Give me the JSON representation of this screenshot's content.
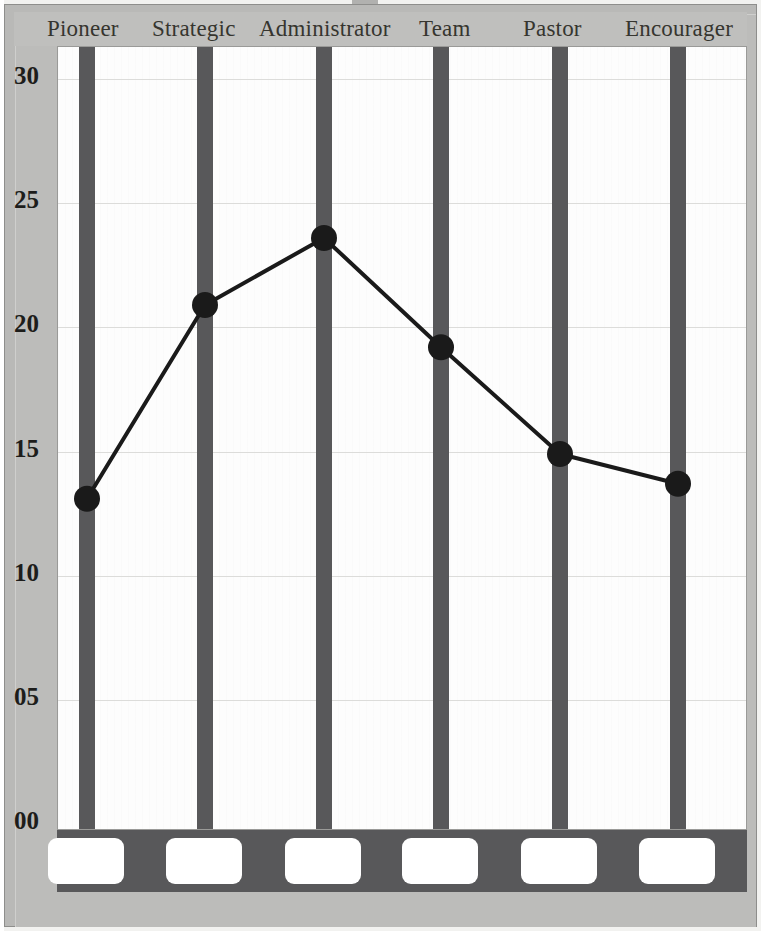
{
  "chart_data": {
    "type": "line",
    "title": "",
    "subtitle": "",
    "xlabel": "",
    "ylabel": "",
    "categories": [
      "Pioneer",
      "Strategic",
      "Administrator",
      "Team",
      "Pastor",
      "Encourager"
    ],
    "values": [
      13.1,
      20.9,
      23.6,
      19.2,
      14.9,
      13.7
    ],
    "series": [
      {
        "name": "Score",
        "values": [
          13.1,
          20.9,
          23.6,
          19.2,
          14.9,
          13.7
        ]
      }
    ],
    "ylim": [
      0,
      31
    ],
    "ytick_labels": [
      "30",
      "25",
      "20",
      "15",
      "10",
      "05",
      "00"
    ],
    "ytick_values": [
      30,
      25,
      20,
      15,
      10,
      5,
      0
    ],
    "grid": true,
    "legend": "none",
    "marker": "circle",
    "line_color": "#1a1a1a",
    "marker_color": "#1a1a1a",
    "bar_color": "#58585a",
    "plot_background": "#fdfdfd",
    "page_background": "#bcbcba"
  },
  "axis": {
    "y_labels": [
      {
        "text": "30",
        "value": 30
      },
      {
        "text": "25",
        "value": 25
      },
      {
        "text": "20",
        "value": 20
      },
      {
        "text": "15",
        "value": 15
      },
      {
        "text": "10",
        "value": 10
      },
      {
        "text": "05",
        "value": 5
      },
      {
        "text": "00",
        "value": 0
      }
    ]
  },
  "header": {
    "labels": [
      {
        "text": "Pioneer",
        "left": 33
      },
      {
        "text": "Strategic",
        "left": 138
      },
      {
        "text": "Administrator",
        "left": 245
      },
      {
        "text": "Team",
        "left": 405
      },
      {
        "text": "Pastor",
        "left": 509
      },
      {
        "text": "Encourager",
        "left": 611
      }
    ]
  },
  "footer": {
    "boxes": [
      {
        "name": "answer-box-pioneer",
        "value": ""
      },
      {
        "name": "answer-box-strategic",
        "value": ""
      },
      {
        "name": "answer-box-administrator",
        "value": ""
      },
      {
        "name": "answer-box-team",
        "value": ""
      },
      {
        "name": "answer-box-pastor",
        "value": ""
      },
      {
        "name": "answer-box-encourager",
        "value": ""
      }
    ]
  }
}
